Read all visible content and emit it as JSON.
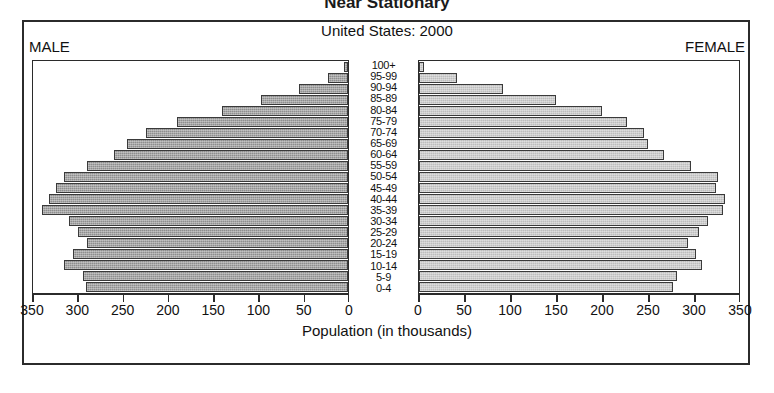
{
  "title": "Near Stationary",
  "subtitle": "United States: 2000",
  "labels": {
    "male": "MALE",
    "female": "FEMALE",
    "axis_caption": "Population (in thousands)"
  },
  "chart_data": {
    "type": "bar",
    "title": "Near Stationary",
    "subtitle": "United States: 2000",
    "xlabel": "Population (in thousands)",
    "ylabel": "",
    "orientation": "horizontal",
    "style": "population-pyramid",
    "grid": false,
    "legend_position": "none",
    "xlim_male": [
      350,
      0
    ],
    "xlim_female": [
      0,
      350
    ],
    "tick_values_male": [
      350,
      300,
      250,
      200,
      150,
      100,
      50,
      0
    ],
    "tick_values_female": [
      0,
      50,
      100,
      150,
      200,
      250,
      300,
      350
    ],
    "categories": [
      "100+",
      "95-99",
      "90-94",
      "85-89",
      "80-84",
      "75-79",
      "70-74",
      "65-69",
      "60-64",
      "55-59",
      "50-54",
      "45-49",
      "40-44",
      "35-39",
      "30-34",
      "25-29",
      "20-24",
      "15-19",
      "10-14",
      "5-9",
      "0-4"
    ],
    "series": [
      {
        "name": "MALE",
        "color": "#8e8e8e",
        "values": [
          5,
          22,
          55,
          97,
          140,
          190,
          225,
          246,
          260,
          290,
          316,
          325,
          332,
          340,
          310,
          300,
          290,
          306,
          316,
          295,
          291
        ]
      },
      {
        "name": "FEMALE",
        "color": "#bdbdbd",
        "values": [
          6,
          42,
          92,
          150,
          200,
          227,
          246,
          250,
          268,
          298,
          327,
          325,
          335,
          333,
          316,
          306,
          294,
          303,
          310,
          282,
          278
        ]
      }
    ],
    "units": "thousands"
  },
  "colors": {
    "male_bar": "#8e8e8e",
    "female_bar": "#bdbdbd",
    "frame": "#2b2b2b",
    "background": "#ffffff"
  }
}
